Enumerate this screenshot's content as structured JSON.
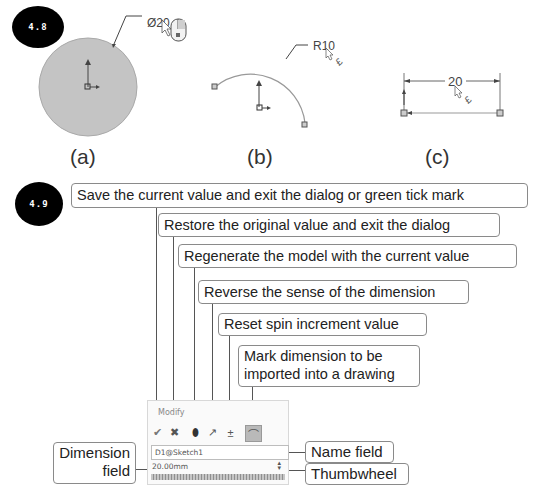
{
  "figure_4_8": {
    "badge": "4.8",
    "panels": [
      {
        "caption": "(a)",
        "dimension_label": "Ø20",
        "entity": "circle"
      },
      {
        "caption": "(b)",
        "dimension_label": "R10",
        "entity": "arc"
      },
      {
        "caption": "(c)",
        "dimension_label": "20",
        "entity": "line"
      }
    ]
  },
  "figure_4_9": {
    "badge": "4.9",
    "callouts": [
      {
        "id": "save",
        "text": "Save the current value and exit the dialog or green tick mark"
      },
      {
        "id": "restore",
        "text": "Restore the original value and exit the dialog"
      },
      {
        "id": "regenerate",
        "text": "Regenerate the model with the current value"
      },
      {
        "id": "reverse",
        "text": "Reverse the sense of the dimension"
      },
      {
        "id": "reset",
        "text": "Reset spin increment value"
      },
      {
        "id": "mark",
        "text": "Mark dimension to be imported into a drawing"
      },
      {
        "id": "dimension_field",
        "text": "Dimension field"
      },
      {
        "id": "name_field",
        "text": "Name field"
      },
      {
        "id": "thumbwheel",
        "text": "Thumbwheel"
      }
    ],
    "dialog": {
      "title": "Modify",
      "toolbar": [
        {
          "name": "ok",
          "glyph": "✔"
        },
        {
          "name": "cancel",
          "glyph": "✖"
        },
        {
          "name": "rebuild",
          "glyph": "⬮"
        },
        {
          "name": "reverse",
          "glyph": "↗"
        },
        {
          "name": "reset-spin",
          "glyph": "±"
        },
        {
          "name": "mark-for-drawing",
          "glyph": "⌒"
        }
      ],
      "name_value": "D1@Sketch1",
      "dimension_value": "20.00mm",
      "spin_glyph": "▴▾"
    }
  }
}
